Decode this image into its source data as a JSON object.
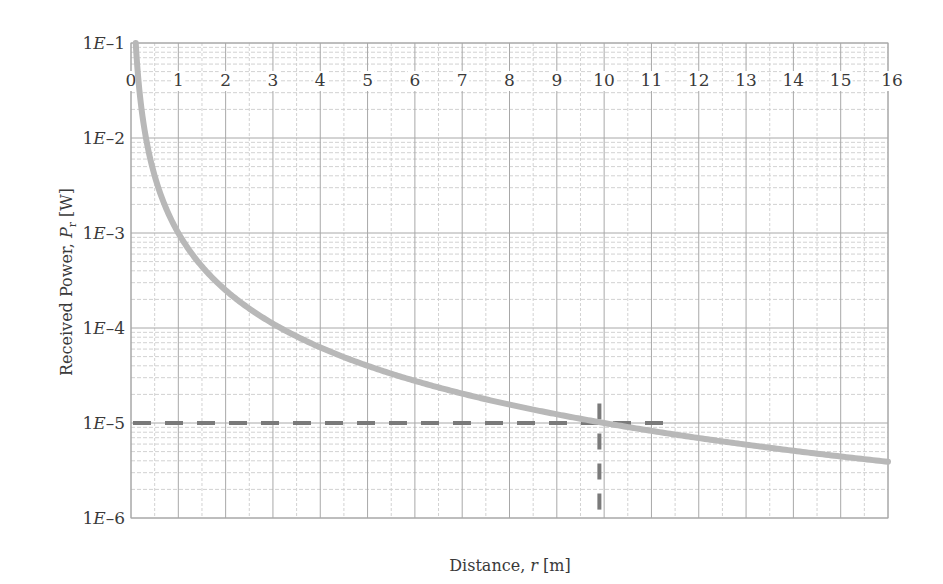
{
  "chart_data": {
    "type": "line",
    "title": "",
    "xlabel": "Distance, r [m]",
    "xlabel_parts": {
      "prefix": "Distance, ",
      "var": "r",
      "suffix": " [m]"
    },
    "ylabel": "Received Power, P_r [W]",
    "ylabel_parts": {
      "prefix": "Received Power, ",
      "var": "P",
      "sub": "r",
      "suffix": " [W]"
    },
    "xlim": [
      0,
      16
    ],
    "ylim": [
      1e-06,
      0.1
    ],
    "yscale": "log",
    "grid": true,
    "x_ticks": [
      "0",
      "1",
      "2",
      "3",
      "4",
      "5",
      "6",
      "7",
      "8",
      "9",
      "10",
      "11",
      "12",
      "13",
      "14",
      "15",
      "16"
    ],
    "y_ticks": [
      {
        "value": 0.1,
        "label": "1E–1"
      },
      {
        "value": 0.01,
        "label": "1E–2"
      },
      {
        "value": 0.001,
        "label": "1E–3"
      },
      {
        "value": 0.0001,
        "label": "1E–4"
      },
      {
        "value": 1e-05,
        "label": "1E–5"
      },
      {
        "value": 1e-06,
        "label": "1E–6"
      }
    ],
    "series": [
      {
        "name": "Received power",
        "formula": "P = 1E-3 / r^2",
        "color": "#b8b8b8",
        "x": [
          0.1,
          0.2,
          0.5,
          1,
          2,
          3,
          4,
          5,
          6,
          7,
          8,
          9,
          10,
          11,
          12,
          13,
          14,
          15,
          16
        ],
        "y": [
          0.1,
          0.025,
          0.004,
          0.001,
          0.00025,
          0.000111,
          6.25e-05,
          4e-05,
          2.78e-05,
          2.04e-05,
          1.56e-05,
          1.23e-05,
          1e-05,
          8.26e-06,
          6.94e-06,
          5.92e-06,
          5.1e-06,
          4.44e-06,
          3.9e-06
        ]
      }
    ],
    "annotations": [
      {
        "type": "hline-dashed",
        "y": 1e-05,
        "x_from": 0,
        "x_to": 11.3,
        "color": "#7a7a7a"
      },
      {
        "type": "vline-dashed",
        "x": 9.9,
        "y_from": 1e-06,
        "y_to": 1.6e-05,
        "color": "#7a7a7a"
      }
    ]
  },
  "colors": {
    "grid_major": "#a8a8a8",
    "grid_minor": "#d2d2d2",
    "curve": "#b8b8b8",
    "dashed": "#7a7a7a",
    "text": "#3a3a3a"
  }
}
